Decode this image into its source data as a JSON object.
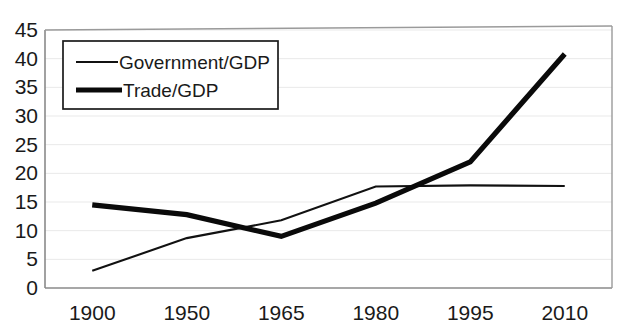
{
  "chart_data": {
    "type": "line",
    "title": "",
    "subtitle": "",
    "xlabel": "",
    "ylabel": "",
    "categories": [
      "1900",
      "1950",
      "1965",
      "1980",
      "1995",
      "2010"
    ],
    "ylim": [
      0,
      45
    ],
    "ytick_values": [
      0,
      5,
      10,
      15,
      20,
      25,
      30,
      35,
      40,
      45
    ],
    "ytick_labels": [
      "0",
      "5",
      "10",
      "15",
      "20",
      "25",
      "30",
      "35",
      "40",
      "45"
    ],
    "grid": true,
    "grid_axis": "y",
    "legend_position": "top-left",
    "series": [
      {
        "name": "Government/GDP",
        "style": "thin",
        "color": "#111111",
        "values": [
          3.0,
          8.7,
          11.8,
          17.7,
          17.9,
          17.8
        ]
      },
      {
        "name": "Trade/GDP",
        "style": "thick",
        "color": "#0a0a0a",
        "values": [
          14.5,
          12.8,
          9.0,
          14.8,
          22.0,
          40.8
        ]
      }
    ],
    "annotations": []
  },
  "legend": {
    "entries": [
      {
        "label": "Government/GDP",
        "style": "thin"
      },
      {
        "label": "Trade/GDP",
        "style": "thick"
      }
    ]
  }
}
